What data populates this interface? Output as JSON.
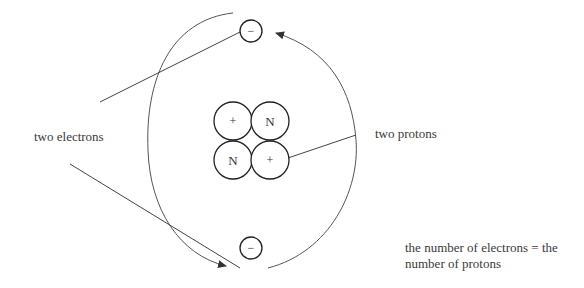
{
  "diagram": {
    "type": "helium-atom-model",
    "labels": {
      "electrons": "two electrons",
      "protons": "two protons",
      "note_line1": "the number of electrons = the",
      "note_line2": "number of protons"
    },
    "nucleus": [
      {
        "symbol": "+",
        "kind": "proton"
      },
      {
        "symbol": "N",
        "kind": "neutron"
      },
      {
        "symbol": "N",
        "kind": "neutron"
      },
      {
        "symbol": "+",
        "kind": "proton"
      }
    ],
    "electrons": [
      {
        "symbol": "−",
        "position": "top"
      },
      {
        "symbol": "−",
        "position": "bottom"
      }
    ],
    "colors": {
      "stroke": "#333333",
      "text": "#3a3a3a",
      "background": "#ffffff"
    }
  }
}
